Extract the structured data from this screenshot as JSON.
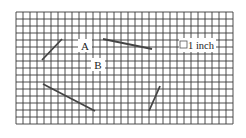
{
  "diagram": {
    "grid": {
      "left": 16,
      "top": 12,
      "cell": 7,
      "cols": 31,
      "rows": 16,
      "line_color": "#3a3a3a"
    },
    "labels": {
      "point_a": "A",
      "point_b": "B",
      "scale": "1 inch"
    },
    "segments": [
      {
        "x1": 42,
        "y1": 60,
        "x2": 62,
        "y2": 39
      },
      {
        "x1": 103,
        "y1": 39,
        "x2": 152,
        "y2": 49
      },
      {
        "x1": 43,
        "y1": 84,
        "x2": 95,
        "y2": 111
      },
      {
        "x1": 149,
        "y1": 111,
        "x2": 160,
        "y2": 86
      }
    ],
    "segment_color": "#444444"
  }
}
